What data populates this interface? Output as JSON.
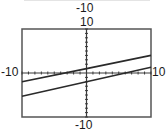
{
  "chart_data": {
    "type": "line",
    "title": "",
    "xlabel": "",
    "ylabel": "",
    "xlim": [
      -10,
      10
    ],
    "ylim": [
      -10,
      10
    ],
    "grid": false,
    "axes_ticks": {
      "x_step": 1,
      "y_step": 1
    },
    "window_labels": {
      "top_extra": "-10",
      "ymax": "10",
      "ymin": "-10",
      "xmin": "-10",
      "xmax": "10"
    },
    "series": [
      {
        "name": "upper line",
        "equation": "y = 0.3x + 1",
        "x": [
          -10,
          0,
          10
        ],
        "y": [
          -2,
          1,
          4
        ]
      },
      {
        "name": "lower line",
        "equation": "y = 0.33x - 2",
        "x": [
          -10,
          0,
          10
        ],
        "y": [
          -5.3,
          -2,
          1.3
        ]
      }
    ],
    "colors": {
      "line": "#2a2a2a",
      "axis": "#3a3a3a",
      "frame": "#555555"
    }
  },
  "labels": {
    "top_caption": "-10",
    "ymax": "10",
    "ymin": "-10",
    "xmin": "-10",
    "xmax": "10"
  }
}
